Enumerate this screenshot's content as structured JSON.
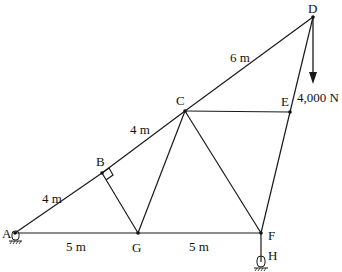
{
  "diagram": {
    "type": "truss",
    "nodes": {
      "A": {
        "x": 15,
        "y": 233,
        "label": "A",
        "lx": 2,
        "ly": 238
      },
      "B": {
        "x": 102,
        "y": 173,
        "label": "B",
        "lx": 96,
        "ly": 166
      },
      "C": {
        "x": 185,
        "y": 111,
        "label": "C",
        "lx": 176,
        "ly": 105
      },
      "D": {
        "x": 313,
        "y": 17,
        "label": "D",
        "lx": 308,
        "ly": 13
      },
      "E": {
        "x": 290,
        "y": 112,
        "label": "E",
        "lx": 281,
        "ly": 106
      },
      "F": {
        "x": 261,
        "y": 233,
        "label": "F",
        "lx": 268,
        "ly": 240
      },
      "G": {
        "x": 138,
        "y": 233,
        "label": "G",
        "lx": 132,
        "ly": 252
      },
      "H": {
        "x": 261,
        "y": 262,
        "label": "H",
        "lx": 268,
        "ly": 260
      }
    },
    "members": [
      [
        "A",
        "B"
      ],
      [
        "B",
        "C"
      ],
      [
        "C",
        "D"
      ],
      [
        "A",
        "G"
      ],
      [
        "G",
        "F"
      ],
      [
        "B",
        "G"
      ],
      [
        "C",
        "G"
      ],
      [
        "C",
        "F"
      ],
      [
        "C",
        "E"
      ],
      [
        "D",
        "E"
      ],
      [
        "E",
        "F"
      ],
      [
        "F",
        "H"
      ]
    ],
    "dimensions": [
      {
        "text": "4 m",
        "x": 42,
        "y": 203
      },
      {
        "text": "4 m",
        "x": 130,
        "y": 134
      },
      {
        "text": "6 m",
        "x": 230,
        "y": 62
      },
      {
        "text": "5 m",
        "x": 66,
        "y": 251
      },
      {
        "text": "5 m",
        "x": 189,
        "y": 251
      }
    ],
    "load": {
      "text": "4,000 N",
      "node": "D",
      "x": 297,
      "y": 102
    },
    "supports": [
      {
        "node": "A",
        "type": "pin"
      },
      {
        "node": "H",
        "type": "pin"
      }
    ]
  }
}
